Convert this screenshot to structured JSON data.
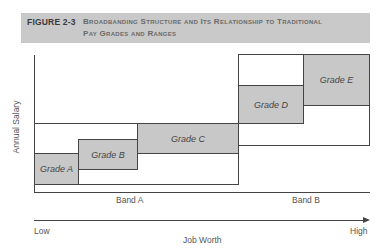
{
  "caption": {
    "label": "FIGURE 2-3",
    "title_line1": "Broadbanding Structure and Its Relationship to Traditional",
    "title_line2": "Pay Grades and Ranges",
    "background": "#c9c9c9"
  },
  "diagram": {
    "y_axis_label": "Annual Salary",
    "x_axis_label": "Job Worth",
    "x_axis_low": "Low",
    "x_axis_high": "High",
    "bands": [
      {
        "label": "Band A"
      },
      {
        "label": "Band B"
      }
    ],
    "grades": [
      {
        "label": "Grade A",
        "band": "Band A"
      },
      {
        "label": "Grade B",
        "band": "Band A"
      },
      {
        "label": "Grade C",
        "band": "Band A"
      },
      {
        "label": "Grade D",
        "band": "Band B"
      },
      {
        "label": "Grade E",
        "band": "Band B"
      }
    ],
    "grade_fill": "#c8c8c8"
  }
}
